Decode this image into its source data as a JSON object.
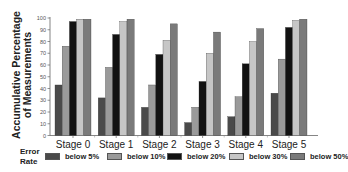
{
  "chart_data": {
    "type": "bar",
    "title": "",
    "xlabel": "",
    "ylabel": "Accumulative Percentage of Measurements",
    "ylabel_lines": [
      "Accumulative Percentage",
      "of Measurements"
    ],
    "ylim": [
      0,
      100
    ],
    "yticks": [
      0,
      10,
      20,
      30,
      40,
      50,
      60,
      70,
      80,
      90,
      100
    ],
    "grid": false,
    "legend_position": "bottom",
    "legend_title": "Error Rate",
    "legend_title_lines": [
      "Error",
      "Rate"
    ],
    "categories": [
      "Stage 0",
      "Stage 1",
      "Stage 2",
      "Stage 3",
      "Stage 4",
      "Stage 5"
    ],
    "series": [
      {
        "name": "below 5%",
        "color": "#4a4a4a",
        "values": [
          43,
          32,
          24,
          11,
          16,
          36
        ]
      },
      {
        "name": "below 10%",
        "color": "#9a9a9a",
        "values": [
          76,
          58,
          43,
          24,
          33,
          65
        ]
      },
      {
        "name": "below 20%",
        "color": "#121212",
        "values": [
          97,
          86,
          69,
          46,
          61,
          92
        ]
      },
      {
        "name": "below 30%",
        "color": "#c6c6c6",
        "values": [
          99,
          97,
          81,
          70,
          80,
          98
        ]
      },
      {
        "name": "below 50%",
        "color": "#7a7a7a",
        "values": [
          99,
          99,
          95,
          88,
          91,
          99
        ]
      }
    ]
  }
}
